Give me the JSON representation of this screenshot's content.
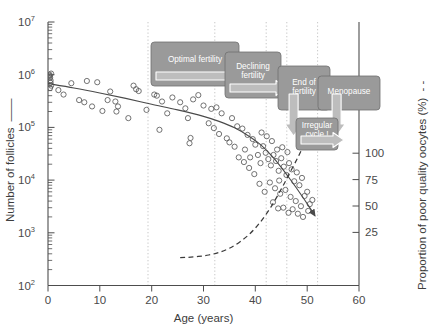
{
  "chart_data": {
    "type": "scatter",
    "title": "",
    "xlabel": "Age (years)",
    "ylabel": "Number of follicles",
    "ylabel_right": "Proportion of poor quality oocytes (%)",
    "ylabel_right_legend_dash": "- -",
    "ylabel_left_legend_dash": "—",
    "xlim": [
      0,
      60
    ],
    "ylim_left_log10": [
      2,
      7
    ],
    "ylim_right": [
      0,
      125
    ],
    "grid": "vertical-dotted-only",
    "legend_position": "inline-with-axis-titles",
    "xticks": [
      0,
      10,
      20,
      30,
      40,
      50,
      60
    ],
    "xticklabels": [
      "0",
      "10",
      "20",
      "30",
      "40",
      "50",
      "60"
    ],
    "yticks_left_labels": [
      "10^2",
      "10^3",
      "10^4",
      "10^5",
      "10^6",
      "10^7"
    ],
    "yticks_left_mantissa": [
      "10",
      "10",
      "10",
      "10",
      "10",
      "10"
    ],
    "yticks_left_exponent": [
      "2",
      "3",
      "4",
      "5",
      "6",
      "7"
    ],
    "yticks_right": [
      25,
      50,
      75,
      100
    ],
    "yticklabels_right": [
      "25",
      "50",
      "75",
      "100"
    ],
    "vertical_gridlines_age": [
      18,
      31,
      41,
      45,
      51
    ],
    "series": [
      {
        "name": "Number of follicles (scatter)",
        "type": "scatter",
        "marker": "open-circle",
        "color": "#555555",
        "points": [
          [
            0.3,
            1000000
          ],
          [
            0.4,
            880000
          ],
          [
            0.5,
            780000
          ],
          [
            0.5,
            700000
          ],
          [
            0.6,
            620000
          ],
          [
            0.4,
            560000
          ],
          [
            0.6,
            1050000
          ],
          [
            0.35,
            950000
          ],
          [
            7.5,
            760000
          ],
          [
            9.5,
            720000
          ],
          [
            6.0,
            330000
          ],
          [
            7.0,
            300000
          ],
          [
            8.5,
            250000
          ],
          [
            11.5,
            330000
          ],
          [
            13.0,
            310000
          ],
          [
            13.5,
            250000
          ],
          [
            13.2,
            200000
          ],
          [
            16.5,
            620000
          ],
          [
            17.0,
            530000
          ],
          [
            17.5,
            490000
          ],
          [
            15.5,
            150000
          ],
          [
            20.5,
            420000
          ],
          [
            21.0,
            400000
          ],
          [
            22.0,
            310000
          ],
          [
            24.0,
            370000
          ],
          [
            25.5,
            300000
          ],
          [
            23.0,
            185000
          ],
          [
            21.5,
            90000
          ],
          [
            26.5,
            230000
          ],
          [
            27.0,
            150000
          ],
          [
            27.5,
            63000
          ],
          [
            27.3,
            50000
          ],
          [
            30.0,
            260000
          ],
          [
            31.5,
            225000
          ],
          [
            32.5,
            240000
          ],
          [
            33.5,
            185000
          ],
          [
            31.0,
            120000
          ],
          [
            32.0,
            97000
          ],
          [
            33.0,
            75000
          ],
          [
            34.5,
            62000
          ],
          [
            35.5,
            150000
          ],
          [
            36.5,
            105000
          ],
          [
            35.0,
            52000
          ],
          [
            36.0,
            43000
          ],
          [
            37.5,
            95000
          ],
          [
            38.5,
            72000
          ],
          [
            38.0,
            38000
          ],
          [
            39.5,
            60000
          ],
          [
            40.0,
            47000
          ],
          [
            39.0,
            27000
          ],
          [
            40.5,
            30000
          ],
          [
            41.5,
            44000
          ],
          [
            41.0,
            21000
          ],
          [
            42.0,
            33000
          ],
          [
            42.5,
            25000
          ],
          [
            43.0,
            19000
          ],
          [
            43.5,
            30000
          ],
          [
            44.0,
            23000
          ],
          [
            44.5,
            15000
          ],
          [
            45.0,
            26000
          ],
          [
            45.5,
            18000
          ],
          [
            46.0,
            12500
          ],
          [
            46.5,
            21000
          ],
          [
            47.0,
            16000
          ],
          [
            47.5,
            9500
          ],
          [
            48.0,
            14000
          ],
          [
            48.5,
            8000
          ],
          [
            49.0,
            11000
          ],
          [
            42.8,
            9000
          ],
          [
            43.8,
            7000
          ],
          [
            44.8,
            5500
          ],
          [
            45.8,
            6500
          ],
          [
            46.8,
            4800
          ],
          [
            47.8,
            4000
          ],
          [
            48.8,
            3200
          ],
          [
            49.5,
            5000
          ],
          [
            50.0,
            6000
          ],
          [
            50.5,
            3500
          ],
          [
            51.0,
            4200
          ],
          [
            41.8,
            6000
          ],
          [
            40.8,
            8500
          ],
          [
            39.8,
            13000
          ],
          [
            38.8,
            17000
          ],
          [
            37.8,
            22000
          ],
          [
            36.8,
            27000
          ],
          [
            44.2,
            38000
          ],
          [
            45.2,
            42000
          ],
          [
            46.2,
            34000
          ],
          [
            43.2,
            55000
          ],
          [
            42.2,
            68000
          ],
          [
            41.2,
            80000
          ],
          [
            44.6,
            9800
          ],
          [
            47.2,
            2800
          ],
          [
            48.2,
            2300
          ],
          [
            49.2,
            2000
          ],
          [
            50.2,
            2600
          ],
          [
            46.4,
            2400
          ],
          [
            45.4,
            3000
          ],
          [
            44.4,
            2900
          ],
          [
            43.4,
            3800
          ],
          [
            29.0,
            410000
          ],
          [
            28.0,
            340000
          ],
          [
            19.0,
            215000
          ],
          [
            12.0,
            480000
          ],
          [
            10.5,
            205000
          ],
          [
            4.5,
            690000
          ],
          [
            3.0,
            420000
          ],
          [
            2.0,
            510000
          ]
        ]
      },
      {
        "name": "Number of follicles (fitted decline)",
        "type": "line",
        "style": "solid",
        "color": "#4a4a4a",
        "points": [
          [
            0,
            680000
          ],
          [
            5,
            560000
          ],
          [
            10,
            450000
          ],
          [
            15,
            355000
          ],
          [
            20,
            275000
          ],
          [
            25,
            215000
          ],
          [
            30,
            162000
          ],
          [
            33,
            130000
          ],
          [
            36,
            98000
          ],
          [
            39,
            66000
          ],
          [
            41,
            47000
          ],
          [
            43,
            30000
          ],
          [
            45,
            17500
          ],
          [
            47,
            9500
          ],
          [
            49,
            5000
          ],
          [
            50.5,
            3000
          ],
          [
            51.5,
            2100
          ]
        ],
        "arrow_end": true
      },
      {
        "name": "Proportion of poor quality oocytes",
        "type": "line",
        "style": "dashed",
        "axis": "right",
        "color": "#3b3b3b",
        "points_age_pct": [
          [
            25.5,
            1.0
          ],
          [
            27.0,
            1.4
          ],
          [
            29.0,
            2.2
          ],
          [
            31.0,
            3.6
          ],
          [
            33.0,
            6.0
          ],
          [
            35.0,
            10.0
          ],
          [
            37.0,
            16.0
          ],
          [
            39.0,
            24.0
          ],
          [
            41.0,
            35.0
          ],
          [
            43.0,
            49.0
          ],
          [
            45.0,
            66.0
          ],
          [
            46.5,
            80.0
          ],
          [
            48.0,
            94.0
          ],
          [
            49.0,
            104.0
          ],
          [
            49.8,
            112.0
          ],
          [
            50.3,
            120.0
          ]
        ]
      }
    ],
    "annotations": [
      {
        "id": "optimal-fertility",
        "label": "Optimal fertility",
        "label_lines": [
          "Optimal fertility"
        ],
        "x": 151,
        "y": 42,
        "w": 88,
        "h": 44,
        "arrow": "right",
        "fill": "#9a9a9a"
      },
      {
        "id": "declining-fertility",
        "label": "Declining fertility",
        "label_lines": [
          "Declining",
          "fertility"
        ],
        "x": 225,
        "y": 52,
        "w": 56,
        "h": 46,
        "arrow": "right",
        "fill": "#9a9a9a"
      },
      {
        "id": "end-of-fertility",
        "label": "End of fertility",
        "label_lines": [
          "End of",
          "fertility"
        ],
        "x": 278,
        "y": 66,
        "w": 52,
        "h": 44,
        "arrow": "down",
        "fill": "#9a9a9a"
      },
      {
        "id": "menopause",
        "label": "Menopause",
        "label_lines": [
          "Menopause"
        ],
        "x": 318,
        "y": 76,
        "w": 62,
        "h": 34,
        "arrow": "down",
        "fill": "#9a9a9a"
      },
      {
        "id": "irregular-cycle",
        "label": "Irregular cycle !",
        "label_lines": [
          "Irregular",
          "cycle !"
        ],
        "x": 296,
        "y": 118,
        "w": 42,
        "h": 32,
        "arrow": "right",
        "fill": "#9a9a9a"
      }
    ]
  },
  "figure": {
    "axis_title_left": "Number of follicles",
    "axis_title_left_dash": "——",
    "axis_title_bottom": "Age (years)",
    "axis_title_right": "Proportion of poor quality oocytes (%)",
    "axis_title_right_dash": "- -"
  }
}
